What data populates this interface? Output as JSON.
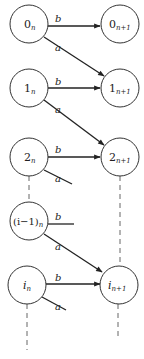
{
  "diagram": {
    "type": "state-transition",
    "nodes": [
      {
        "id": "0n",
        "base": "0",
        "sub": "n",
        "x": 29,
        "y": 24
      },
      {
        "id": "0n1",
        "base": "0",
        "sub": "n+1",
        "x": 120,
        "y": 24
      },
      {
        "id": "1n",
        "base": "1",
        "sub": "n",
        "x": 29,
        "y": 88
      },
      {
        "id": "1n1",
        "base": "1",
        "sub": "n+1",
        "x": 120,
        "y": 88
      },
      {
        "id": "2n",
        "base": "2",
        "sub": "n",
        "x": 29,
        "y": 157
      },
      {
        "id": "2n1",
        "base": "2",
        "sub": "n+1",
        "x": 120,
        "y": 157
      },
      {
        "id": "im1n",
        "base": "(i−1)",
        "sub": "n",
        "x": 29,
        "y": 221
      },
      {
        "id": "in",
        "base": "i",
        "sub": "n",
        "x": 29,
        "y": 285
      },
      {
        "id": "in1",
        "base": "i",
        "sub": "n+1",
        "x": 120,
        "y": 285
      }
    ],
    "edges": [
      {
        "from": "0n",
        "to": "0n1",
        "label": "b"
      },
      {
        "from": "0n",
        "to": "1n1",
        "label": "a"
      },
      {
        "from": "1n",
        "to": "1n1",
        "label": "b"
      },
      {
        "from": "1n",
        "to": "2n1",
        "label": "a"
      },
      {
        "from": "2n",
        "to": "2n1",
        "label": "b"
      },
      {
        "from": "2n",
        "to": null,
        "label": "a"
      },
      {
        "from": "im1n",
        "to": null,
        "label": "b"
      },
      {
        "from": "im1n",
        "to": "in1",
        "label": "a"
      },
      {
        "from": "in",
        "to": "in1",
        "label": "b"
      },
      {
        "from": "in",
        "to": null,
        "label": "a"
      }
    ],
    "edge_labels": {
      "a": "a",
      "b": "b"
    },
    "labels": {
      "n0": "0",
      "n0s": "n",
      "n0p": "0",
      "n0ps": "n+1",
      "n1": "1",
      "n1s": "n",
      "n1p": "1",
      "n1ps": "n+1",
      "n2": "2",
      "n2s": "n",
      "n2p": "2",
      "n2ps": "n+1",
      "nim1": "(i−1)",
      "nim1s": "n",
      "ni": "i",
      "nis": "n",
      "nip": "i",
      "nips": "n+1"
    }
  }
}
